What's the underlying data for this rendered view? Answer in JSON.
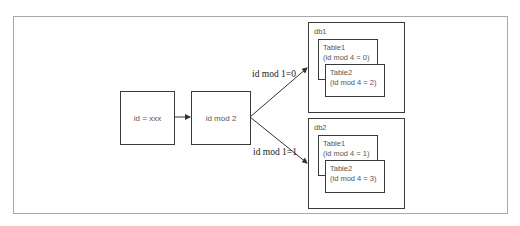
{
  "diagram": {
    "input_node": {
      "label": "id = xxx"
    },
    "router_node": {
      "label": "id mod 2"
    },
    "edges": [
      {
        "label": "id mod 1=0",
        "target": "db1"
      },
      {
        "label": "id mod 1=1",
        "target": "db2"
      }
    ],
    "databases": [
      {
        "name": "db1",
        "tables": [
          {
            "name": "Table1",
            "rule": "(id mod 4 = 0)"
          },
          {
            "name": "Table2",
            "rule": "(id mod 4 = 2)"
          }
        ]
      },
      {
        "name": "db2",
        "tables": [
          {
            "name": "Table1",
            "rule": "(id mod 4 = 1)"
          },
          {
            "name": "Table2",
            "rule": "(id mod 4 = 3)"
          }
        ]
      }
    ]
  }
}
